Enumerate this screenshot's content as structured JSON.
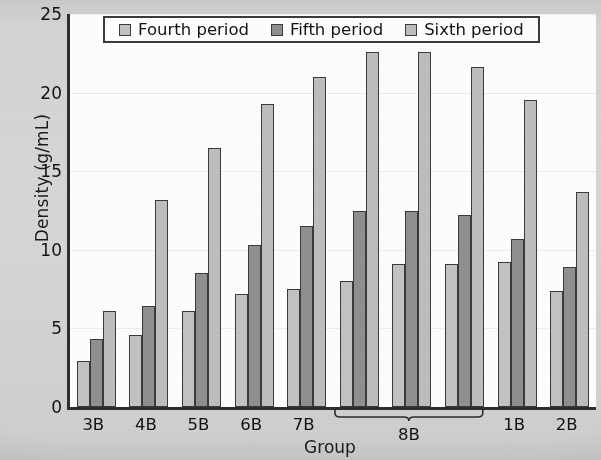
{
  "chart_data": {
    "type": "bar",
    "title": "",
    "xlabel": "Group",
    "ylabel": "Density (g/mL)",
    "ylim": [
      0,
      25
    ],
    "yticks": [
      0,
      5,
      10,
      15,
      20,
      25
    ],
    "grid": true,
    "legend_position": "top-center",
    "categories": [
      "3B",
      "4B",
      "5B",
      "6B",
      "7B",
      "8B",
      "8B",
      "8B",
      "1B",
      "2B"
    ],
    "tick_labels": [
      "3B",
      "4B",
      "5B",
      "6B",
      "7B",
      "8B",
      "1B",
      "2B"
    ],
    "grouped_bracket": {
      "label": "8B",
      "spans_categories": 3,
      "start_index": 5,
      "end_index": 7
    },
    "series": [
      {
        "name": "Fourth period",
        "color": "#c2c2c2",
        "values": [
          2.9,
          4.6,
          6.1,
          7.2,
          7.5,
          8.0,
          9.1,
          9.1,
          9.2,
          7.4
        ]
      },
      {
        "name": "Fifth period",
        "color": "#8f8f8f",
        "values": [
          4.35,
          6.4,
          8.5,
          10.3,
          11.5,
          12.5,
          12.5,
          12.2,
          10.7,
          8.9
        ]
      },
      {
        "name": "Sixth period",
        "color": "#bdbdbd",
        "values": [
          6.1,
          13.2,
          16.5,
          19.3,
          21.0,
          22.6,
          22.6,
          21.6,
          19.5,
          13.7
        ]
      }
    ]
  },
  "axes": {
    "ylabel": "Density (g/mL)",
    "xlabel": "Group"
  },
  "legend": {
    "items": [
      {
        "label": "Fourth period",
        "color": "#c2c2c2"
      },
      {
        "label": "Fifth period",
        "color": "#8f8f8f"
      },
      {
        "label": "Sixth period",
        "color": "#bdbdbd"
      }
    ]
  },
  "colors": {
    "fourth_period": "#c2c2c2",
    "fifth_period": "#8f8f8f",
    "sixth_period": "#bdbdbd",
    "axis": "#2e2e2e",
    "plot_background": "#fdfdfd",
    "page_background": "#d4d4d2"
  }
}
